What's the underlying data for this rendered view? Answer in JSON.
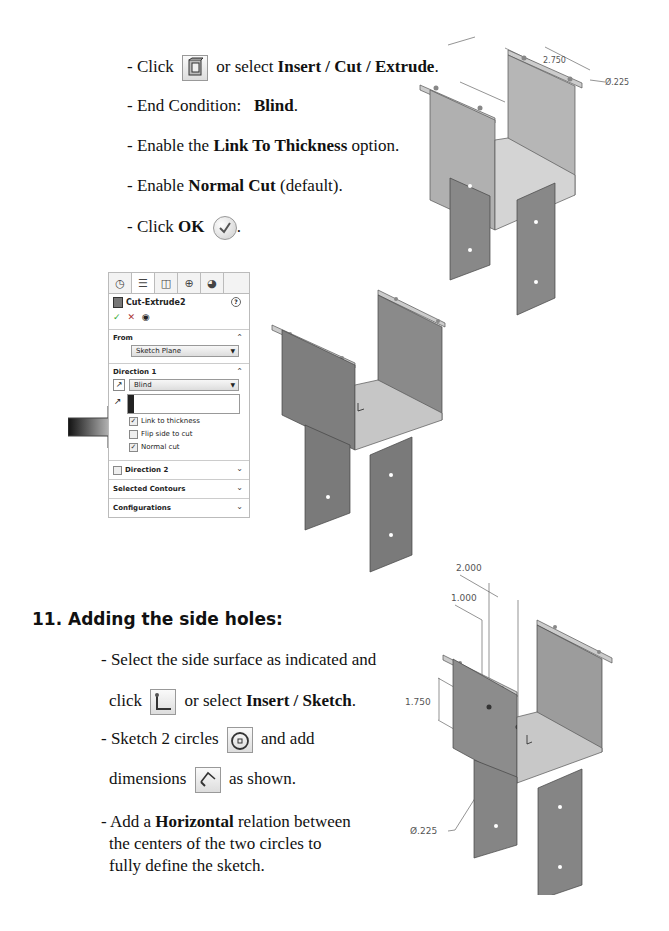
{
  "section_top": {
    "steps": [
      {
        "prefix": "- Click",
        "icon": "extruded-cut-icon",
        "middle": " or select ",
        "bold": "Insert / Cut / Extrude",
        "suffix": "."
      },
      {
        "prefix": "- End Condition:   ",
        "bold": "Blind",
        "suffix": "."
      },
      {
        "prefix": "- Enable the ",
        "bold": "Link To Thickness",
        "suffix": " option."
      },
      {
        "prefix": "- Enable ",
        "bold": "Normal Cut",
        "suffix": " (default)."
      },
      {
        "prefix": "- Click ",
        "bold": "OK",
        "suffix": "."
      }
    ],
    "dims": {
      "d1": "2.750",
      "d2": "Ø.225",
      "d3": ".250"
    }
  },
  "property_manager": {
    "tabs": [
      "feature-manager",
      "property-manager",
      "configuration-manager",
      "dimxpert-manager",
      "display-manager"
    ],
    "title": "Cut-Extrude2",
    "help": "?",
    "actions": {
      "ok": "✓",
      "cancel": "✕",
      "preview": "◉"
    },
    "from": {
      "label": "From",
      "value": "Sketch Plane"
    },
    "direction1": {
      "label": "Direction 1",
      "end_condition": "Blind",
      "options": [
        {
          "label": "Link to thickness",
          "checked": true
        },
        {
          "label": "Flip side to cut",
          "checked": false
        },
        {
          "label": "Normal cut",
          "checked": true
        }
      ]
    },
    "direction2": {
      "label": "Direction 2",
      "checked": false
    },
    "selected_contours": "Selected Contours",
    "configurations": "Configurations"
  },
  "section_11": {
    "heading": "11. Adding the side holes:",
    "steps": [
      {
        "prefix": "- Select the side surface as indicated and"
      },
      {
        "prefix": "click",
        "middle": " or select ",
        "bold": "Insert / Sketch",
        "suffix": "."
      },
      {
        "prefix": "- Sketch 2 circles",
        "suffix": " and add"
      },
      {
        "prefix": "dimensions",
        "suffix": " as shown."
      },
      {
        "prefix": "- Add a ",
        "bold": "Horizontal",
        "suffix": " relation between"
      },
      {
        "prefix": "the centers of the two circles to"
      },
      {
        "prefix": "fully define the sketch."
      }
    ],
    "dims": {
      "d1": "2.000",
      "d2": "1.000",
      "d3": "1.750",
      "d4": "Ø.225"
    }
  }
}
